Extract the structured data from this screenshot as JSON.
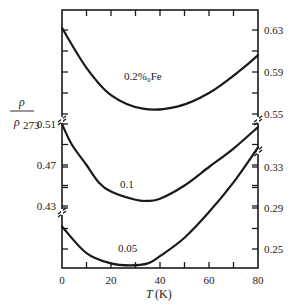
{
  "chart_data": {
    "type": "line",
    "title": "",
    "xlabel": "T (K)",
    "xlabel_var": "T",
    "xlabel_unit": "(K)",
    "ylabel": "ρ/ρ273",
    "ylabel_num": "ρ",
    "ylabel_den": "ρ",
    "ylabel_den_sub": "273",
    "xlim": [
      0,
      80
    ],
    "x_ticks": [
      0,
      10,
      20,
      30,
      40,
      50,
      60,
      70,
      80
    ],
    "x_tick_labels": [
      "0",
      "20",
      "40",
      "60",
      "80"
    ],
    "x_tick_label_values": [
      0,
      20,
      40,
      60,
      80
    ],
    "grid": false,
    "legend": "none (curves labeled inline)",
    "axis_segments": [
      {
        "name": "top",
        "side": "right",
        "range": [
          0.55,
          0.63
        ],
        "labels": [
          "0.63",
          "0.59",
          "0.55"
        ],
        "label_values": [
          0.63,
          0.59,
          0.55
        ],
        "ticks": [
          0.63,
          0.61,
          0.59,
          0.57,
          0.55
        ],
        "broken_below": true
      },
      {
        "name": "middle",
        "side": "left",
        "range": [
          0.43,
          0.51
        ],
        "labels": [
          "0.51",
          "0.47",
          "0.43"
        ],
        "label_values": [
          0.51,
          0.47,
          0.43
        ],
        "ticks": [
          0.51,
          0.49,
          0.47,
          0.45,
          0.43
        ],
        "broken_above": true,
        "broken_below": true
      },
      {
        "name": "bottom",
        "side": "right",
        "range": [
          0.23,
          0.35
        ],
        "labels": [
          "0.33",
          "0.29",
          "0.25"
        ],
        "label_values": [
          0.33,
          0.29,
          0.25
        ],
        "ticks": [
          0.33,
          0.31,
          0.29,
          0.27,
          0.25
        ],
        "broken_above": true
      }
    ],
    "series": [
      {
        "name": "0.2%Fe",
        "label": "0.2%₀Fe",
        "segment": "top",
        "x": [
          0,
          10,
          20,
          33,
          47,
          60,
          73,
          80
        ],
        "y": [
          0.632,
          0.594,
          0.568,
          0.555,
          0.557,
          0.57,
          0.592,
          0.606
        ]
      },
      {
        "name": "0.1",
        "label": "0.1",
        "segment": "middle",
        "x": [
          0,
          4,
          10,
          15,
          20,
          30,
          35,
          40,
          50,
          60,
          70,
          80
        ],
        "y": [
          0.51,
          0.49,
          0.47,
          0.453,
          0.444,
          0.436,
          0.435,
          0.437,
          0.45,
          0.468,
          0.486,
          0.507
        ]
      },
      {
        "name": "0.05",
        "label": "0.05",
        "segment": "bottom",
        "x": [
          0,
          10,
          20,
          28,
          35,
          40,
          50,
          60,
          70,
          80
        ],
        "y": [
          0.272,
          0.246,
          0.236,
          0.234,
          0.236,
          0.243,
          0.261,
          0.286,
          0.315,
          0.349
        ]
      }
    ]
  }
}
